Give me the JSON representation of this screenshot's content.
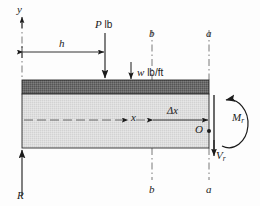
{
  "figure": {
    "type": "engineering-free-body-diagram",
    "colors": {
      "ink": "#1b1b1b",
      "distributed_load_band": "#6a6a6a",
      "beam_body": "#dcdcdc",
      "background": "#fdfdfd",
      "centerline": "#555555"
    }
  },
  "labels": {
    "y_axis": "y",
    "point_load_symbol": "P",
    "point_load_unit": "lb",
    "distributed_load_symbol": "w",
    "distributed_load_unit": "lb/ft",
    "distance_h": "h",
    "distance_x": "x",
    "delta_x": "Δx",
    "section_b_top": "b",
    "section_b_bottom": "b",
    "section_a_top": "a",
    "section_a_bottom": "a",
    "origin_point": "O",
    "moment_symbol": "M",
    "moment_subscript": "r",
    "shear_symbol": "V",
    "shear_subscript": "r",
    "reaction": "R"
  },
  "geometry": {
    "beam_left_x": 22,
    "beam_right_x": 209,
    "beam_top_y": 80,
    "beam_bottom_y": 148,
    "load_band_bottom_y": 94,
    "section_b_x": 152,
    "section_a_x": 209,
    "point_load_x": 105,
    "centerline_y": 120
  }
}
